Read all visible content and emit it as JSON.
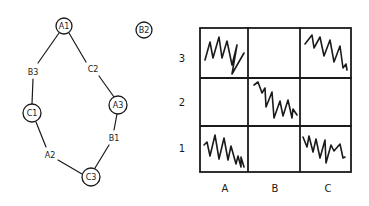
{
  "graph": {
    "nodes": [
      {
        "id": "A1",
        "label": "A1",
        "x": 64,
        "y": 26,
        "circled": true
      },
      {
        "id": "B2",
        "label": "B2",
        "x": 144,
        "y": 30,
        "circled": true
      },
      {
        "id": "B3",
        "label": "B3",
        "x": 33,
        "y": 72,
        "circled": false
      },
      {
        "id": "C2",
        "label": "C2",
        "x": 93,
        "y": 69,
        "circled": false
      },
      {
        "id": "C1",
        "label": "C1",
        "x": 32,
        "y": 113,
        "circled": true
      },
      {
        "id": "A3",
        "label": "A3",
        "x": 118,
        "y": 105,
        "circled": true
      },
      {
        "id": "B1",
        "label": "B1",
        "x": 113,
        "y": 138,
        "circled": false
      },
      {
        "id": "A2",
        "label": "A2",
        "x": 50,
        "y": 155,
        "circled": false
      },
      {
        "id": "C3",
        "label": "C3",
        "x": 91,
        "y": 177,
        "circled": true
      }
    ],
    "edges": [
      [
        "A1",
        "B3"
      ],
      [
        "A1",
        "C2"
      ],
      [
        "B3",
        "C1"
      ],
      [
        "C2",
        "A3"
      ],
      [
        "C1",
        "A2"
      ],
      [
        "A3",
        "B1"
      ],
      [
        "A2",
        "C3"
      ],
      [
        "B1",
        "C3"
      ]
    ]
  },
  "grid": {
    "rows": [
      "3",
      "2",
      "1"
    ],
    "cols": [
      "A",
      "B",
      "C"
    ],
    "filled_cells": [
      "A3",
      "C3",
      "B2",
      "A1",
      "C1"
    ],
    "empty_cells": [
      "B3",
      "A2",
      "C2",
      "B1"
    ]
  },
  "labels": {
    "row_3": "3",
    "row_2": "2",
    "row_1": "1",
    "col_a": "A",
    "col_b": "B",
    "col_c": "C",
    "n_a1": "A1",
    "n_b2": "B2",
    "n_b3": "B3",
    "n_c2": "C2",
    "n_c1": "C1",
    "n_a3": "A3",
    "n_b1": "B1",
    "n_a2": "A2",
    "n_c3": "C3"
  }
}
